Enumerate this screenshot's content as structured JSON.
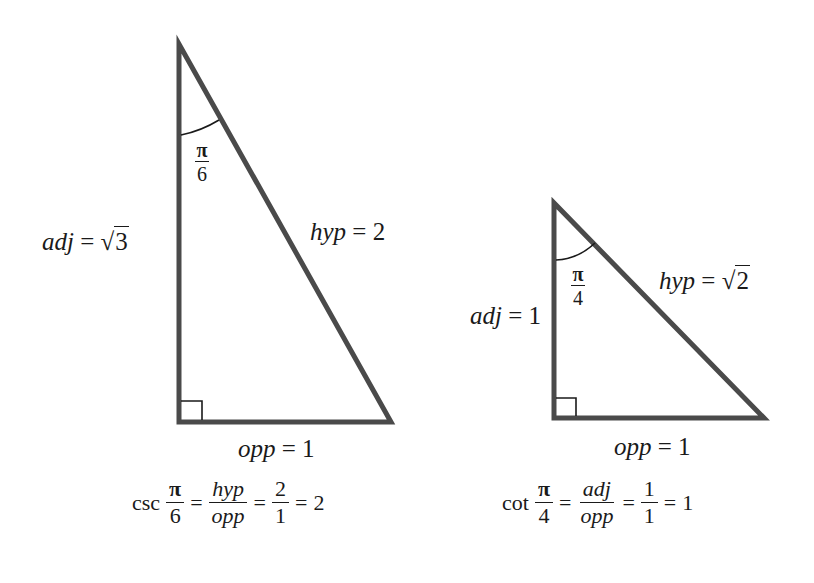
{
  "colors": {
    "stroke": "#4a4a4a",
    "text": "#1a1a1a",
    "background": "#ffffff"
  },
  "left_triangle": {
    "angle": {
      "num": "π",
      "den": "6"
    },
    "adj_label": "adj",
    "adj_eq": "=",
    "adj_value_radicand": "3",
    "hyp_label": "hyp",
    "hyp_eq": "=",
    "hyp_value": "2",
    "opp_label": "opp",
    "opp_eq": "=",
    "opp_value": "1",
    "formula": {
      "func": "csc",
      "angle_num": "π",
      "angle_den": "6",
      "eq1": "=",
      "ratio_num": "hyp",
      "ratio_den": "opp",
      "eq2": "=",
      "value_num": "2",
      "value_den": "1",
      "eq3": "=",
      "result": "2"
    }
  },
  "right_triangle": {
    "angle": {
      "num": "π",
      "den": "4"
    },
    "adj_label": "adj",
    "adj_eq": "=",
    "adj_value": "1",
    "hyp_label": "hyp",
    "hyp_eq": "=",
    "hyp_value_radicand": "2",
    "opp_label": "opp",
    "opp_eq": "=",
    "opp_value": "1",
    "formula": {
      "func": "cot",
      "angle_num": "π",
      "angle_den": "4",
      "eq1": "=",
      "ratio_num": "adj",
      "ratio_den": "opp",
      "eq2": "=",
      "value_num": "1",
      "value_den": "1",
      "eq3": "=",
      "result": "1"
    }
  }
}
